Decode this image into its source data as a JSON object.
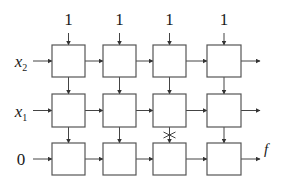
{
  "diagram": {
    "type": "systolic-array",
    "top_inputs": [
      {
        "label": "1",
        "x": 68
      },
      {
        "label": "1",
        "x": 119
      },
      {
        "label": "1",
        "x": 170
      },
      {
        "label": "1",
        "x": 224
      }
    ],
    "row_inputs": [
      {
        "var": "x",
        "sub": "2",
        "y": 61
      },
      {
        "var": "x",
        "sub": "1",
        "y": 110
      },
      {
        "var": "0",
        "sub": "",
        "y": 159
      }
    ],
    "columns": [
      {
        "x": 52,
        "w": 33
      },
      {
        "x": 103,
        "w": 33
      },
      {
        "x": 153,
        "w": 33
      },
      {
        "x": 207,
        "w": 34
      }
    ],
    "rows": [
      {
        "y": 45,
        "h": 32
      },
      {
        "y": 94,
        "h": 33
      },
      {
        "y": 143,
        "h": 32
      }
    ],
    "blocked_connection": {
      "row": 1,
      "col": 2,
      "mark": "cross"
    },
    "output_annotation": "f",
    "colors": {
      "line": "#444444",
      "box_stroke": "#555555",
      "text": "#1a1a1a"
    }
  }
}
